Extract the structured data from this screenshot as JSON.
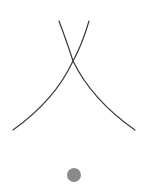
{
  "figure": {
    "width": 145,
    "height": 191,
    "background": "#ffffff",
    "stroke_color": "#3a3a3a",
    "stroke_width": 1.2,
    "curves": [
      {
        "name": "left-curve",
        "path": "M 59 21 Q 68 45 73 61 Q 55 100 13 130"
      },
      {
        "name": "right-curve",
        "path": "M 89 21 Q 82 45 73 61 Q 92 100 135 130"
      }
    ],
    "dot": {
      "cx": 74,
      "cy": 175,
      "r": 7,
      "color": "#8a8a8a"
    }
  }
}
